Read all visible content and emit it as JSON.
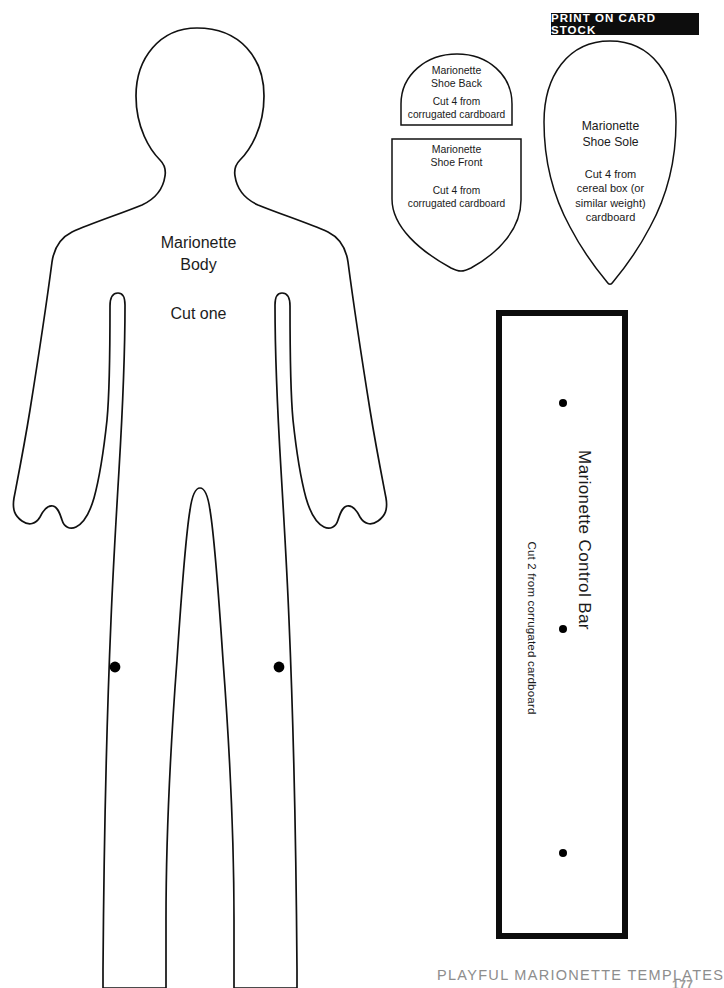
{
  "page": {
    "background_color": "#ffffff",
    "ink_color": "#111111",
    "width": 709,
    "height": 988
  },
  "banner": {
    "label": "PRINT ON CARD STOCK",
    "background_color": "#0d0d0d",
    "text_color": "#ffffff"
  },
  "templates": {
    "body": {
      "icon": "human-body-silhouette-icon",
      "title_line1": "Marionette",
      "title_line2": "Body",
      "instruction": "Cut one",
      "pivot_dots": 2
    },
    "shoe_back": {
      "icon": "dome-shape-icon",
      "title_line1": "Marionette",
      "title_line2": "Shoe Back",
      "instruction_line1": "Cut 4 from",
      "instruction_line2": "corrugated cardboard"
    },
    "shoe_front": {
      "icon": "shield-shape-icon",
      "title_line1": "Marionette",
      "title_line2": "Shoe Front",
      "instruction_line1": "Cut 4 from",
      "instruction_line2": "corrugated cardboard"
    },
    "shoe_sole": {
      "icon": "teardrop-shape-icon",
      "title_line1": "Marionette",
      "title_line2": "Shoe Sole",
      "instruction_line1": "Cut 4 from",
      "instruction_line2": "cereal box (or",
      "instruction_line3": "similar weight)",
      "instruction_line4": "cardboard"
    },
    "control_bar": {
      "icon": "rectangle-bar-icon",
      "title": "Marionette Control Bar",
      "instruction": "Cut 2 from corrugated cardboard",
      "pivot_dots": 3
    }
  },
  "footer": {
    "title": "PLAYFUL MARIONETTE TEMPLATES",
    "page_number": "177",
    "text_color": "#8d8d8d"
  }
}
